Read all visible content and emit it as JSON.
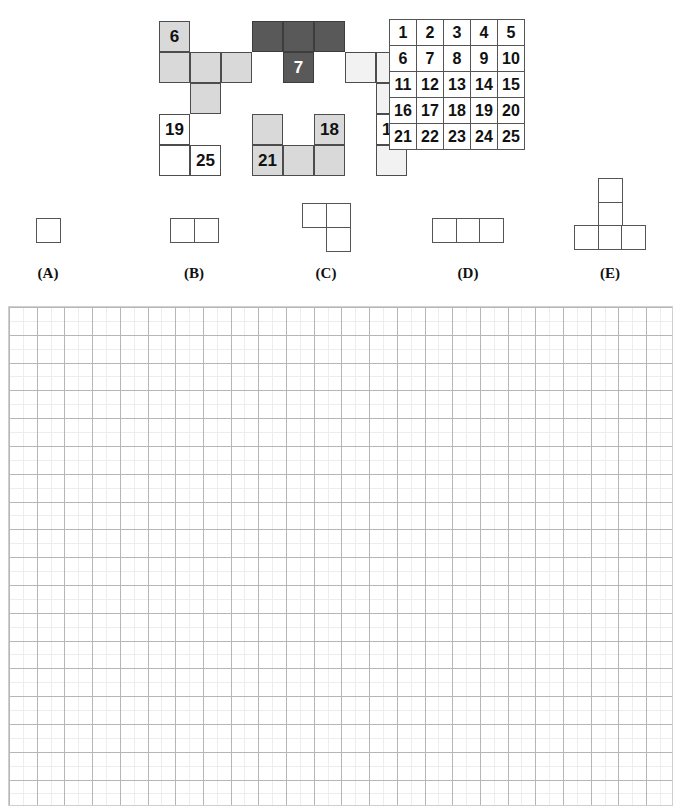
{
  "header": {
    "cut_off_text": "",
    "visible": false
  },
  "figure": {
    "name": "polyomino-number-map",
    "cell_size": 31,
    "origin": {
      "x": 159,
      "y": 21
    },
    "colors": {
      "white": "#ffffff",
      "light_gray": "#d9d9d9",
      "pale_gray": "#f2f2f2",
      "dark_gray": "#595959",
      "border": "#4d4d4d"
    },
    "cells": [
      {
        "col": 0,
        "row": 0,
        "fill": "light",
        "label": "6"
      },
      {
        "col": 3,
        "row": 0,
        "fill": "dark",
        "label": ""
      },
      {
        "col": 4,
        "row": 0,
        "fill": "dark",
        "label": ""
      },
      {
        "col": 5,
        "row": 0,
        "fill": "dark",
        "label": ""
      },
      {
        "col": 0,
        "row": 1,
        "fill": "light",
        "label": ""
      },
      {
        "col": 1,
        "row": 1,
        "fill": "light",
        "label": ""
      },
      {
        "col": 2,
        "row": 1,
        "fill": "light",
        "label": ""
      },
      {
        "col": 4,
        "row": 1,
        "fill": "dark",
        "label": "7"
      },
      {
        "col": 6,
        "row": 1,
        "fill": "pale",
        "label": ""
      },
      {
        "col": 7,
        "row": 1,
        "fill": "pale",
        "label": ""
      },
      {
        "col": 1,
        "row": 2,
        "fill": "light",
        "label": ""
      },
      {
        "col": 7,
        "row": 2,
        "fill": "pale",
        "label": ""
      },
      {
        "col": 0,
        "row": 3,
        "fill": "white",
        "label": "19"
      },
      {
        "col": 3,
        "row": 3,
        "fill": "light",
        "label": ""
      },
      {
        "col": 5,
        "row": 3,
        "fill": "light",
        "label": "18"
      },
      {
        "col": 7,
        "row": 3,
        "fill": "white",
        "label": "15"
      },
      {
        "col": 0,
        "row": 4,
        "fill": "white",
        "label": ""
      },
      {
        "col": 1,
        "row": 4,
        "fill": "white",
        "label": "25"
      },
      {
        "col": 3,
        "row": 4,
        "fill": "light",
        "label": "21"
      },
      {
        "col": 4,
        "row": 4,
        "fill": "light",
        "label": ""
      },
      {
        "col": 5,
        "row": 4,
        "fill": "light",
        "label": ""
      },
      {
        "col": 7,
        "row": 4,
        "fill": "pale",
        "label": ""
      }
    ]
  },
  "number_table": {
    "name": "numbered-5x5-table",
    "rows": [
      [
        "1",
        "2",
        "3",
        "4",
        "5"
      ],
      [
        "6",
        "7",
        "8",
        "9",
        "10"
      ],
      [
        "11",
        "12",
        "13",
        "14",
        "15"
      ],
      [
        "16",
        "17",
        "18",
        "19",
        "20"
      ],
      [
        "21",
        "22",
        "23",
        "24",
        "25"
      ]
    ]
  },
  "options": [
    {
      "id": "A",
      "label": "(A)",
      "label_x": 18,
      "label_y": 95,
      "shape_x": 36,
      "shape_y": 48,
      "cell_count": 1,
      "cells": [
        {
          "col": 0,
          "row": 0
        }
      ]
    },
    {
      "id": "B",
      "label": "(B)",
      "label_x": 164,
      "label_y": 95,
      "shape_x": 170,
      "shape_y": 48,
      "cell_count": 2,
      "cells": [
        {
          "col": 0,
          "row": 0
        },
        {
          "col": 1,
          "row": 0
        }
      ]
    },
    {
      "id": "C",
      "label": "(C)",
      "label_x": 296,
      "label_y": 95,
      "shape_x": 302,
      "shape_y": 33,
      "cell_count": 3,
      "cells": [
        {
          "col": 0,
          "row": 0
        },
        {
          "col": 1,
          "row": 0
        },
        {
          "col": 1,
          "row": 1
        }
      ]
    },
    {
      "id": "D",
      "label": "(D)",
      "label_x": 438,
      "label_y": 95,
      "shape_x": 432,
      "shape_y": 48,
      "cell_count": 3,
      "cells": [
        {
          "col": 0,
          "row": 0
        },
        {
          "col": 1,
          "row": 0
        },
        {
          "col": 2,
          "row": 0
        }
      ]
    },
    {
      "id": "E",
      "label": "(E)",
      "label_x": 580,
      "label_y": 95,
      "shape_x": 574,
      "shape_y": 8,
      "cell_count": 5,
      "cells": [
        {
          "col": 1,
          "row": 0
        },
        {
          "col": 1,
          "row": 1
        },
        {
          "col": 0,
          "row": 2
        },
        {
          "col": 1,
          "row": 2
        },
        {
          "col": 2,
          "row": 2
        }
      ]
    }
  ],
  "answer_grid": {
    "name": "answer-worksheet-grid",
    "columns": 24,
    "rows": 18,
    "major_line_color": "#b6b6b6",
    "minor_line_color": "#ededed",
    "background": "#ffffff"
  }
}
